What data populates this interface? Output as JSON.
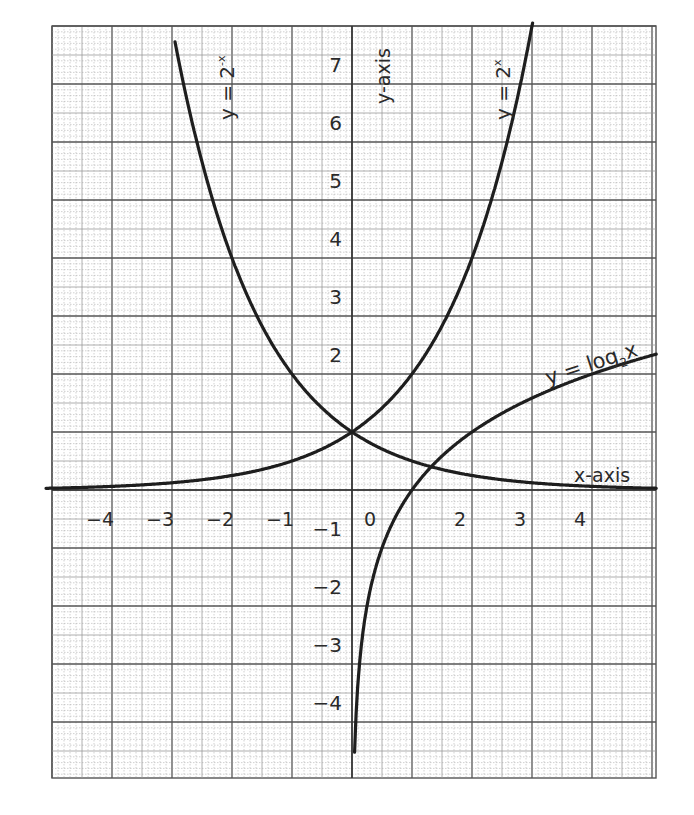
{
  "chart_data": {
    "type": "line",
    "title": "",
    "xlabel": "x-axis",
    "ylabel": "y-axis",
    "xlim": [
      -5,
      5
    ],
    "ylim": [
      -5,
      8
    ],
    "grid": true,
    "x_tick_labels": [
      "-4",
      "-3",
      "-2",
      "-1",
      "0",
      "2",
      "3",
      "4"
    ],
    "x_tick_values": [
      -4,
      -3,
      -2,
      -1,
      0,
      2,
      3,
      4
    ],
    "y_tick_labels": [
      "7",
      "6",
      "5",
      "4",
      "3",
      "2",
      "-1",
      "-2",
      "-3",
      "-4"
    ],
    "y_tick_values": [
      7,
      6,
      5,
      4,
      3,
      2,
      -1,
      -2,
      -3,
      -4
    ],
    "series": [
      {
        "name": "y = 2^x",
        "label": "y = 2ˣ",
        "x": [
          -5,
          -4,
          -3,
          -2,
          -1,
          0,
          1,
          2,
          2.5,
          3
        ],
        "values": [
          0.03,
          0.06,
          0.13,
          0.25,
          0.5,
          1,
          2,
          4,
          5.66,
          8
        ]
      },
      {
        "name": "y = 2^-x",
        "label": "y = 2⁻ˣ",
        "x": [
          -3,
          -2.5,
          -2,
          -1,
          0,
          1,
          2,
          3,
          4,
          5
        ],
        "values": [
          8,
          5.66,
          4,
          2,
          1,
          0.5,
          0.25,
          0.13,
          0.06,
          0.03
        ]
      },
      {
        "name": "y = log2 x",
        "label": "y = log₂x",
        "x": [
          0.03,
          0.0625,
          0.125,
          0.25,
          0.5,
          1,
          2,
          3,
          4,
          5
        ],
        "values": [
          -5,
          -4,
          -3,
          -2,
          -1,
          0,
          1,
          1.58,
          2,
          2.32
        ]
      }
    ],
    "annotations": [
      "y = 2ˣ",
      "y = 2⁻ˣ",
      "y = log₂x",
      "x-axis",
      "y-axis"
    ]
  },
  "labels": {
    "x_axis": "x-axis",
    "y_axis": "y-axis",
    "curve_exp": "y = 2",
    "curve_exp_sup": "x",
    "curve_exp_neg": "y = 2",
    "curve_exp_neg_sup": "-x",
    "curve_log": "y = log",
    "curve_log_sub": "2",
    "curve_log_x": "x"
  },
  "colors": {
    "grid_minor": "#9a9a9a",
    "grid_major": "#555555",
    "curve": "#1e1e1e",
    "text": "#2a2a2a"
  }
}
